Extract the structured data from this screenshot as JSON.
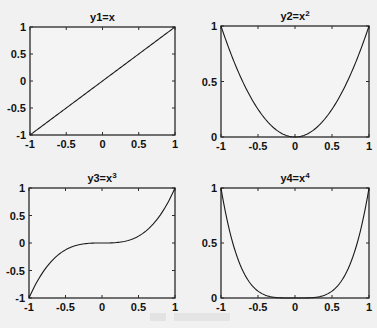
{
  "chart_data": [
    {
      "type": "line",
      "title": "y1=x",
      "title_base": "y1=x",
      "title_sup": "",
      "function": "x",
      "x": [
        -1,
        -0.75,
        -0.5,
        -0.25,
        0,
        0.25,
        0.5,
        0.75,
        1
      ],
      "y": [
        -1,
        -0.75,
        -0.5,
        -0.25,
        0,
        0.25,
        0.5,
        0.75,
        1
      ],
      "xlim": [
        -1,
        1
      ],
      "ylim": [
        -1,
        1
      ],
      "xticks": [
        "-1",
        "-0.5",
        "0",
        "0.5",
        "1"
      ],
      "yticks": [
        "-1",
        "-0.5",
        "0",
        "0.5",
        "1"
      ],
      "xlabel": "",
      "ylabel": "",
      "grid": false
    },
    {
      "type": "line",
      "title": "y2=x^2",
      "title_base": "y2=x",
      "title_sup": "2",
      "function": "x^2",
      "x": [
        -1,
        -0.75,
        -0.5,
        -0.25,
        0,
        0.25,
        0.5,
        0.75,
        1
      ],
      "y": [
        1,
        0.5625,
        0.25,
        0.0625,
        0,
        0.0625,
        0.25,
        0.5625,
        1
      ],
      "xlim": [
        -1,
        1
      ],
      "ylim": [
        0,
        1
      ],
      "xticks": [
        "-1",
        "-0.5",
        "0",
        "0.5",
        "1"
      ],
      "yticks": [
        "0",
        "0.5",
        "1"
      ],
      "xlabel": "",
      "ylabel": "",
      "grid": false
    },
    {
      "type": "line",
      "title": "y3=x^3",
      "title_base": "y3=x",
      "title_sup": "3",
      "function": "x^3",
      "x": [
        -1,
        -0.75,
        -0.5,
        -0.25,
        0,
        0.25,
        0.5,
        0.75,
        1
      ],
      "y": [
        -1,
        -0.4219,
        -0.125,
        -0.0156,
        0,
        0.0156,
        0.125,
        0.4219,
        1
      ],
      "xlim": [
        -1,
        1
      ],
      "ylim": [
        -1,
        1
      ],
      "xticks": [
        "-1",
        "-0.5",
        "0",
        "0.5",
        "1"
      ],
      "yticks": [
        "-1",
        "-0.5",
        "0",
        "0.5",
        "1"
      ],
      "xlabel": "",
      "ylabel": "",
      "grid": false
    },
    {
      "type": "line",
      "title": "y4=x^4",
      "title_base": "y4=x",
      "title_sup": "4",
      "function": "x^4",
      "x": [
        -1,
        -0.75,
        -0.5,
        -0.25,
        0,
        0.25,
        0.5,
        0.75,
        1
      ],
      "y": [
        1,
        0.3164,
        0.0625,
        0.0039,
        0,
        0.0039,
        0.0625,
        0.3164,
        1
      ],
      "xlim": [
        -1,
        1
      ],
      "ylim": [
        0,
        1
      ],
      "xticks": [
        "-1",
        "-0.5",
        "0",
        "0.5",
        "1"
      ],
      "yticks": [
        "0",
        "0.5",
        "1"
      ],
      "xlabel": "",
      "ylabel": "",
      "grid": false
    }
  ],
  "style": {
    "line_color": "#1a1a1a",
    "axis_color": "#2a2a2a",
    "background": "#f1f1f1",
    "plot_background": "#f4f4f4"
  }
}
